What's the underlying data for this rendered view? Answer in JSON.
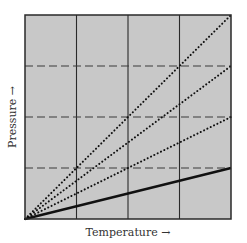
{
  "chart_data": {
    "type": "line",
    "title": "",
    "xlabel": "Temperature →",
    "ylabel": "Pressure →",
    "xlim": [
      0,
      4
    ],
    "ylim": [
      0,
      4
    ],
    "grid": {
      "vertical": {
        "style": "solid",
        "positions": [
          1,
          2,
          3
        ]
      },
      "horizontal": {
        "style": "dashed",
        "positions": [
          1,
          2,
          3
        ]
      }
    },
    "background_color": "#c8c8c8",
    "tick_labels": false,
    "legend": null,
    "series": [
      {
        "name": "line-1",
        "style": "dotted",
        "x": [
          0,
          4
        ],
        "y": [
          0,
          4
        ]
      },
      {
        "name": "line-2",
        "style": "dotted",
        "x": [
          0,
          4
        ],
        "y": [
          0,
          3
        ]
      },
      {
        "name": "line-3",
        "style": "dotted",
        "x": [
          0,
          4
        ],
        "y": [
          0,
          2
        ]
      },
      {
        "name": "line-4",
        "style": "solid-thick",
        "x": [
          0,
          4
        ],
        "y": [
          0,
          1
        ]
      }
    ]
  },
  "labels": {
    "x_axis": "Temperature →",
    "y_axis": "Pressure →"
  }
}
